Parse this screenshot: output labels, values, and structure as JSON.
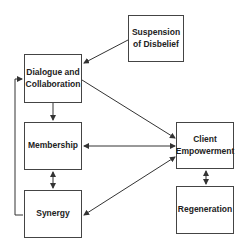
{
  "nodes": {
    "suspension": {
      "label": "Suspension of Disbelief"
    },
    "dialogue": {
      "label": "Dialogue and Collaboration"
    },
    "membership": {
      "label": "Membership"
    },
    "synergy": {
      "label": "Synergy"
    },
    "client": {
      "label": "Client Empowerment"
    },
    "regeneration": {
      "label": "Regeneration"
    }
  },
  "edges": [
    {
      "from": "suspension",
      "to": "dialogue",
      "type": "one-way"
    },
    {
      "from": "dialogue",
      "to": "membership",
      "type": "one-way"
    },
    {
      "from": "dialogue",
      "to": "client",
      "type": "one-way"
    },
    {
      "from": "membership",
      "to": "client",
      "type": "two-way"
    },
    {
      "from": "membership",
      "to": "synergy",
      "type": "two-way"
    },
    {
      "from": "synergy",
      "to": "client",
      "type": "two-way"
    },
    {
      "from": "client",
      "to": "regeneration",
      "type": "two-way"
    },
    {
      "from": "synergy",
      "to": "dialogue",
      "type": "loop"
    }
  ]
}
